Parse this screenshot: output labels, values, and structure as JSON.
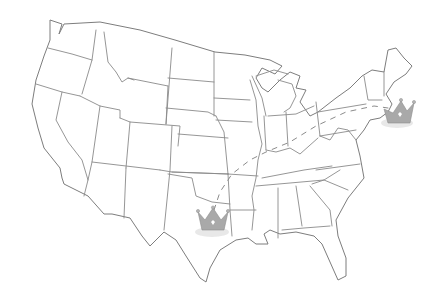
{
  "map": {
    "subject": "United States (contiguous states) outline map, hand-drawn style",
    "style": {
      "background": "#ffffff",
      "border_color": "#8a8a8a",
      "crown_color": "#a9a9a9",
      "route_color": "#8c8c8c"
    },
    "markers": [
      {
        "name": "crown-texas",
        "icon": "crown-icon",
        "region": "Texas (Dallas area)",
        "x": 210,
        "y": 225
      },
      {
        "name": "crown-northeast",
        "icon": "crown-icon",
        "region": "Northeast (New York / New England area)",
        "x": 398,
        "y": 113
      }
    ],
    "route": {
      "style": "dashed",
      "from": "Texas",
      "to": "Northeast",
      "via": [
        "Oklahoma",
        "Arkansas/Missouri",
        "Kentucky",
        "Ohio/Pennsylvania"
      ]
    }
  }
}
